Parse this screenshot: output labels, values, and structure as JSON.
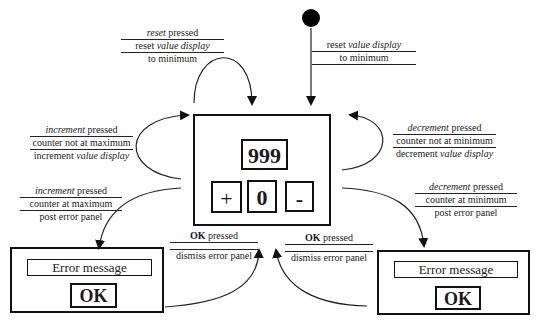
{
  "diagram": {
    "type": "state-transition-diagram",
    "initial_state": {
      "shape": "filled-circle",
      "color": "#000000"
    },
    "states": {
      "counter": {
        "display_value": "999",
        "buttons": {
          "plus": "+",
          "zero": "0",
          "minus": "-"
        }
      },
      "error_left": {
        "message": "Error message",
        "ok_label": "OK"
      },
      "error_right": {
        "message": "Error message",
        "ok_label": "OK"
      }
    },
    "transitions": {
      "initial": {
        "action_a_plain": "reset ",
        "action_a_italic": "value display",
        "action_b": "to minimum"
      },
      "reset": {
        "event_italic": "reset",
        "event_plain": " pressed",
        "action_a_plain": "reset ",
        "action_a_italic": "value display",
        "action_b": "to minimum"
      },
      "increment_ok": {
        "event_italic": "increment",
        "event_plain": " pressed",
        "guard": "counter not at maximum",
        "action_plain": "increment ",
        "action_italic": "value display"
      },
      "decrement_ok": {
        "event_italic": "decrement",
        "event_plain": " pressed",
        "guard": "counter not at minimum",
        "action_plain": "decrement ",
        "action_italic": "value display"
      },
      "increment_max": {
        "event_italic": "increment",
        "event_plain": " pressed",
        "guard": "counter at maximum",
        "action": "post error panel"
      },
      "decrement_min": {
        "event_italic": "decrement",
        "event_plain": " pressed",
        "guard": "counter at minimum",
        "action": "post error panel"
      },
      "dismiss_left": {
        "event_bold": "OK",
        "event_plain": " pressed",
        "action": "dismiss error panel"
      },
      "dismiss_right": {
        "event_bold": "OK",
        "event_plain": " pressed",
        "action": "dismiss error panel"
      }
    }
  }
}
